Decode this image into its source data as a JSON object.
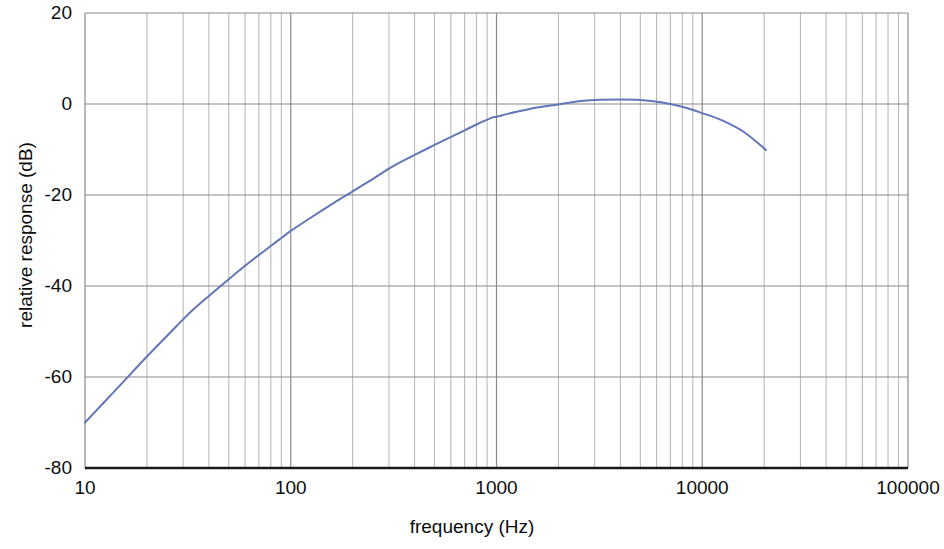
{
  "chart_data": {
    "type": "line",
    "title": "",
    "subtitle": "",
    "xlabel": "frequency (Hz)",
    "ylabel": "relative response (dB)",
    "xscale": "log",
    "yscale": "linear",
    "xlim": [
      10,
      100000
    ],
    "ylim": [
      -80,
      20
    ],
    "grid": true,
    "grid_minor": true,
    "legend": null,
    "annotations": [],
    "xticks": [
      10,
      100,
      1000,
      10000,
      100000
    ],
    "xtick_labels": [
      "10",
      "100",
      "1000",
      "10000",
      "100000"
    ],
    "yticks": [
      20,
      0,
      -20,
      -40,
      -60,
      -80
    ],
    "ytick_labels": [
      "20",
      "0",
      "-20",
      "-40",
      "-60",
      "-80"
    ],
    "x_minor_multipliers": [
      2,
      3,
      4,
      5,
      6,
      7,
      8,
      9
    ],
    "series": [
      {
        "name": "relative response",
        "color": "#6276b8",
        "line_width": 2,
        "x": [
          10,
          12,
          14,
          16,
          18,
          20,
          25,
          31.6,
          40,
          50,
          63,
          80,
          91,
          100,
          125,
          160,
          200,
          250,
          316,
          400,
          500,
          630,
          800,
          950,
          1000,
          1250,
          1600,
          2000,
          2500,
          3000,
          4000,
          5000,
          6300,
          8000,
          10000,
          12500,
          16000,
          20400
        ],
        "y": [
          -70.0,
          -66.2,
          -63.0,
          -60.2,
          -57.7,
          -55.5,
          -51.0,
          -46.3,
          -42.2,
          -38.5,
          -34.8,
          -31.2,
          -29.3,
          -27.9,
          -25.0,
          -21.9,
          -19.2,
          -16.5,
          -13.6,
          -11.2,
          -9.0,
          -6.8,
          -4.5,
          -3.0,
          -2.8,
          -1.7,
          -0.7,
          -0.1,
          0.6,
          0.9,
          1.0,
          0.9,
          0.4,
          -0.6,
          -2.0,
          -3.6,
          -6.2,
          -10.1
        ]
      }
    ],
    "axis_colors": {
      "major_grid": "#8a8a8a",
      "minor_grid": "#b4b4b4",
      "bottom_axis": "#1a1a1a",
      "curve": "#6276b8"
    },
    "plot_box_px": {
      "left": 85,
      "right": 908,
      "top": 13,
      "bottom": 468
    }
  }
}
